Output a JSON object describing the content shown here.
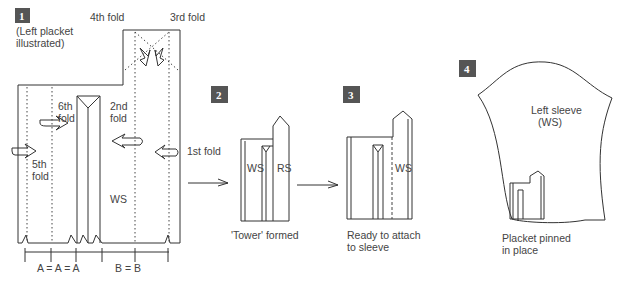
{
  "steps": [
    {
      "number": "1",
      "caption": "(Left placket illustrated)"
    },
    {
      "number": "2",
      "caption": "'Tower' formed"
    },
    {
      "number": "3",
      "caption": "Ready to attach to sleeve"
    },
    {
      "number": "4",
      "caption": "Placket pinned in place"
    }
  ],
  "step1": {
    "caption_line1": "(Left placket",
    "caption_line2": "illustrated)",
    "folds": {
      "first": "1st fold",
      "second_line1": "2nd",
      "second_line2": "fold",
      "third": "3rd fold",
      "fourth": "4th fold",
      "fifth_line1": "5th",
      "fifth_line2": "fold",
      "sixth_line1": "6th",
      "sixth_line2": "fold"
    },
    "ws_label": "WS",
    "measure": {
      "a": "A  =  A  =  A",
      "b": "B   =    B"
    }
  },
  "step2": {
    "ws": "WS",
    "rs": "RS",
    "caption": "'Tower' formed"
  },
  "step3": {
    "ws": "WS",
    "caption_line1": "Ready to attach",
    "caption_line2": "to sleeve"
  },
  "step4": {
    "sleeve_line1": "Left sleeve",
    "sleeve_line2": "(WS)",
    "caption_line1": "Placket pinned",
    "caption_line2": "in place"
  },
  "colors": {
    "badge": "#555555",
    "line": "#333333"
  }
}
